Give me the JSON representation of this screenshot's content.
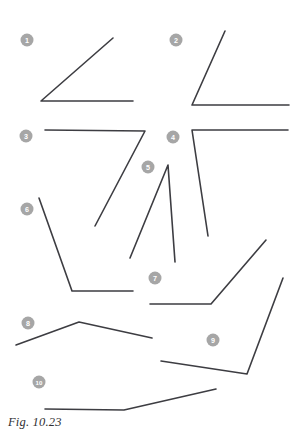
{
  "figure": {
    "caption": "Fig. 10.23",
    "stroke_color": "#3d3d42",
    "marker_color": "#a6a6a6",
    "marker_text_color": "#ffffff",
    "background_color": "#ffffff",
    "width": 299,
    "height": 438
  },
  "angles": [
    {
      "label": "1",
      "marker": {
        "cx": 27,
        "cy": 40,
        "r": 6.5
      },
      "vertex": {
        "x": 41,
        "y": 101
      },
      "rays": [
        {
          "x": 113,
          "y": 38
        },
        {
          "x": 133,
          "y": 101
        }
      ],
      "path": "M 113,38 L 41,101 L 133,101"
    },
    {
      "label": "2",
      "marker": {
        "cx": 176,
        "cy": 40,
        "r": 6.5
      },
      "vertex": {
        "x": 192,
        "y": 105
      },
      "rays": [
        {
          "x": 225,
          "y": 31
        },
        {
          "x": 289,
          "y": 105
        }
      ],
      "path": "M 225,31 L 192,105 L 289,105"
    },
    {
      "label": "3",
      "marker": {
        "cx": 26,
        "cy": 136,
        "r": 6.5
      },
      "vertex": {
        "x": 145,
        "y": 131
      },
      "rays": [
        {
          "x": 45,
          "y": 130
        },
        {
          "x": 95,
          "y": 226
        }
      ],
      "path": "M 45,130 L 145,131 L 95,226"
    },
    {
      "label": "4",
      "marker": {
        "cx": 173,
        "cy": 137,
        "r": 6.5
      },
      "vertex": {
        "x": 192,
        "y": 130
      },
      "rays": [
        {
          "x": 288,
          "y": 130
        },
        {
          "x": 208,
          "y": 236
        }
      ],
      "path": "M 288,130 L 192,130 L 208,236"
    },
    {
      "label": "5",
      "marker": {
        "cx": 148,
        "cy": 167,
        "r": 6.5
      },
      "vertex": {
        "x": 168,
        "y": 165
      },
      "rays": [
        {
          "x": 130,
          "y": 258
        },
        {
          "x": 175,
          "y": 262
        }
      ],
      "path": "M 130,258 L 168,165 L 175,262"
    },
    {
      "label": "6",
      "marker": {
        "cx": 27,
        "cy": 209,
        "r": 6.5
      },
      "vertex": {
        "x": 72,
        "y": 291
      },
      "rays": [
        {
          "x": 39,
          "y": 198
        },
        {
          "x": 133,
          "y": 291
        }
      ],
      "path": "M 39,198 L 72,291 L 133,291"
    },
    {
      "label": "7",
      "marker": {
        "cx": 155,
        "cy": 278,
        "r": 6.5
      },
      "vertex": {
        "x": 211,
        "y": 304
      },
      "rays": [
        {
          "x": 150,
          "y": 304
        },
        {
          "x": 266,
          "y": 240
        }
      ],
      "path": "M 150,304 L 211,304 L 266,240"
    },
    {
      "label": "8",
      "marker": {
        "cx": 28,
        "cy": 323,
        "r": 6.5
      },
      "vertex": {
        "x": 79,
        "y": 322
      },
      "rays": [
        {
          "x": 16,
          "y": 345
        },
        {
          "x": 152,
          "y": 338
        }
      ],
      "path": "M 16,345 L 79,322 L 152,338"
    },
    {
      "label": "9",
      "marker": {
        "cx": 213,
        "cy": 340,
        "r": 6.5
      },
      "vertex": {
        "x": 247,
        "y": 374
      },
      "rays": [
        {
          "x": 161,
          "y": 361
        },
        {
          "x": 283,
          "y": 278
        }
      ],
      "path": "M 161,361 L 247,374 L 283,278"
    },
    {
      "label": "10",
      "marker": {
        "cx": 39,
        "cy": 382,
        "r": 6.5
      },
      "vertex": {
        "x": 124,
        "y": 410
      },
      "rays": [
        {
          "x": 45,
          "y": 409
        },
        {
          "x": 216,
          "y": 389
        }
      ],
      "path": "M 45,409 L 124,410 L 216,389"
    }
  ]
}
